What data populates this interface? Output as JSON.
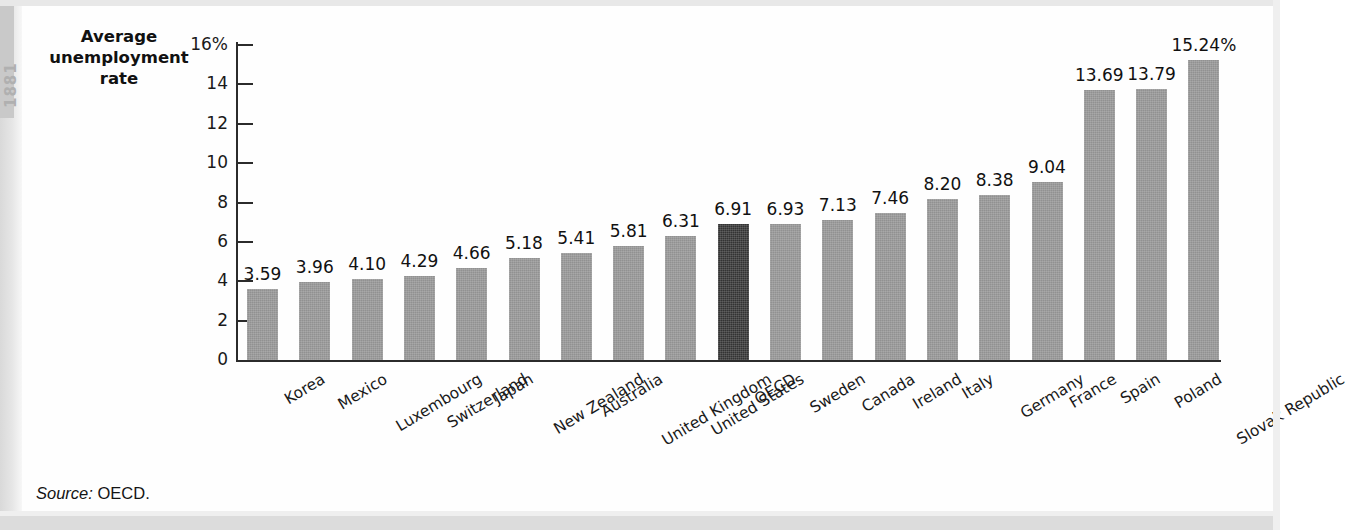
{
  "figure": {
    "axis_title": "Average\nunemployment\nrate",
    "source_prefix": "Source:",
    "source_value": "OECD.",
    "margin_tab_text": "1881"
  },
  "colors": {
    "bar": "#919191",
    "highlight_bar": "#333333",
    "axis": "#2b2b2b",
    "background": "#fefefe",
    "text": "#111111"
  },
  "chart_data": {
    "type": "bar",
    "title": "Average unemployment rate",
    "xlabel": "",
    "ylabel": "Average unemployment rate",
    "ylim": [
      0,
      16
    ],
    "grid": false,
    "legend": "none",
    "y_ticks": [
      0,
      2,
      4,
      6,
      8,
      10,
      12,
      14,
      16
    ],
    "y_tick_labels": [
      "0",
      "2",
      "4",
      "6",
      "8",
      "10",
      "12",
      "14",
      "16%"
    ],
    "highlight_category": "OECD",
    "categories": [
      "Korea",
      "Mexico",
      "Luxembourg",
      "Switzerland",
      "Japan",
      "New Zealand",
      "Australia",
      "United Kingdom",
      "United States",
      "OECD",
      "Sweden",
      "Canada",
      "Ireland",
      "Italy",
      "Germany",
      "France",
      "Spain",
      "Poland",
      "Slovak Republic"
    ],
    "values": [
      3.59,
      3.96,
      4.1,
      4.29,
      4.66,
      5.18,
      5.41,
      5.81,
      6.31,
      6.91,
      6.93,
      7.13,
      7.46,
      8.2,
      8.38,
      9.04,
      13.69,
      13.79,
      15.24
    ],
    "value_labels": [
      "3.59",
      "3.96",
      "4.10",
      "4.29",
      "4.66",
      "5.18",
      "5.41",
      "5.81",
      "6.31",
      "6.91",
      "6.93",
      "7.13",
      "7.46",
      "8.20",
      "8.38",
      "9.04",
      "13.69",
      "13.79",
      "15.24%"
    ]
  }
}
